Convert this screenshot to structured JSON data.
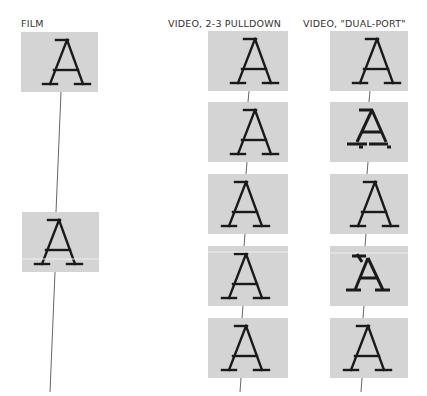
{
  "columns": [
    {
      "id": "film",
      "label": "FILM",
      "frames": 2
    },
    {
      "id": "pulldown",
      "label": "VIDEO, 2-3 PULLDOWN",
      "frames": 5
    },
    {
      "id": "dualport",
      "label": "VIDEO, \"DUAL-PORT\"",
      "frames": 5
    }
  ],
  "glyph": "A",
  "colors": {
    "frame_bg": "#d4d4d4",
    "glyph": "#1a1a1a",
    "line": "#555555"
  }
}
